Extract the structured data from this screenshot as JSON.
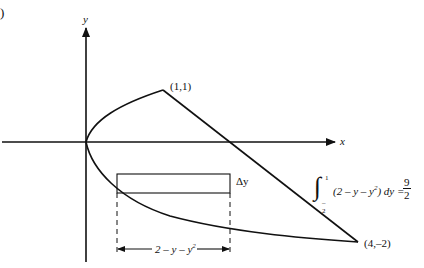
{
  "figure": {
    "corner_mark": ")",
    "axes": {
      "x_label": "x",
      "y_label": "y"
    },
    "points": [
      {
        "label": "(1,1)",
        "x": 1,
        "y": 1
      },
      {
        "label": "(4,–2)",
        "x": 4,
        "y": -2
      }
    ],
    "curves": [
      {
        "name": "parabola",
        "equation": "x = y^2",
        "y_range": [
          -2,
          1
        ]
      },
      {
        "name": "line",
        "equation": "x = 2 - y",
        "y_range": [
          -2,
          1
        ]
      }
    ],
    "strip": {
      "height_label": "Δy",
      "width_label": "2 – y – y²",
      "width_label_base": "2 – y – y",
      "width_label_exp": "2"
    },
    "integral": {
      "upper": "1",
      "lower": "–2",
      "integrand_pre": "(2 – y – y",
      "integrand_exp": "2",
      "integrand_post": ") dy =",
      "result_num": "9",
      "result_den": "2"
    }
  }
}
